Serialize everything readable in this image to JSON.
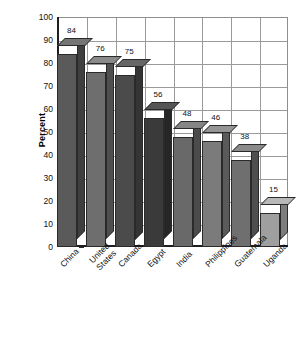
{
  "chart_data": {
    "type": "bar",
    "title": "",
    "subtitle": "",
    "xlabel": "",
    "ylabel": "Percent",
    "categories": [
      "China",
      "United States",
      "Canada",
      "Egypt",
      "India",
      "Philippines",
      "Guatemala",
      "Uganda"
    ],
    "category_lines": [
      [
        "China"
      ],
      [
        "United",
        "States"
      ],
      [
        "Canada"
      ],
      [
        "Egypt"
      ],
      [
        "India"
      ],
      [
        "Philippines"
      ],
      [
        "Guatemala"
      ],
      [
        "Uganda"
      ]
    ],
    "values": [
      84,
      76,
      75,
      56,
      48,
      46,
      38,
      15
    ],
    "value_labels": [
      "84",
      "76",
      "75",
      "56",
      "48",
      "46",
      "38",
      "15"
    ],
    "ylim": [
      0,
      100
    ],
    "ytick_labels": [
      "0",
      "10",
      "20",
      "30",
      "40",
      "50",
      "60",
      "70",
      "80",
      "90",
      "100"
    ],
    "ytick_values": [
      0,
      10,
      20,
      30,
      40,
      50,
      60,
      70,
      80,
      90,
      100
    ],
    "grid": "both",
    "legend": "none",
    "style": "3d-bars-grayscale",
    "bar_colors": [
      "#5a5a5a",
      "#6e6e6e",
      "#4b4b4b",
      "#3a3a3a",
      "#696969",
      "#7b7b7b",
      "#6f6f6f",
      "#9f9f9f"
    ],
    "bar_top_colors": [
      "#757575",
      "#8a8a8a",
      "#666666",
      "#555555",
      "#858585",
      "#949494",
      "#8a8a8a",
      "#b8b8b8"
    ],
    "bar_side_colors": [
      "#3f3f3f",
      "#4f4f4f",
      "#343434",
      "#262626",
      "#4b4b4b",
      "#5a5a5a",
      "#4f4f4f",
      "#7d7d7d"
    ]
  },
  "axis": {
    "y_title": "Percent"
  }
}
